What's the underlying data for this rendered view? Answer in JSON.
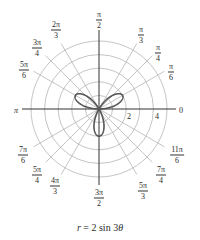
{
  "chart_data": {
    "type": "polar",
    "title": "r = 2 sin 3θ",
    "equation": "r = 2 sin 3θ",
    "curve": {
      "function": "2*sin(3*theta)",
      "theta_range": [
        0,
        3.14159265
      ],
      "petals": 3,
      "max_r": 2,
      "petal_directions": [
        "π/6",
        "5π/6",
        "3π/2"
      ],
      "color": "#555555"
    },
    "radial_circles": [
      1,
      2,
      3,
      4,
      5
    ],
    "radial_tick_labels": [
      "2",
      "4"
    ],
    "angle_labels": [
      {
        "num": "π",
        "den": "6",
        "angle_deg": 30
      },
      {
        "num": "π",
        "den": "4",
        "angle_deg": 45
      },
      {
        "num": "π",
        "den": "3",
        "angle_deg": 60
      },
      {
        "num": "π",
        "den": "2",
        "angle_deg": 90
      },
      {
        "num": "2π",
        "den": "3",
        "angle_deg": 120
      },
      {
        "num": "3π",
        "den": "4",
        "angle_deg": 135
      },
      {
        "num": "5π",
        "den": "6",
        "angle_deg": 150
      },
      {
        "num": "7π",
        "den": "6",
        "angle_deg": 210
      },
      {
        "num": "5π",
        "den": "4",
        "angle_deg": 225
      },
      {
        "num": "4π",
        "den": "3",
        "angle_deg": 240
      },
      {
        "num": "3π",
        "den": "2",
        "angle_deg": 270
      },
      {
        "num": "5π",
        "den": "3",
        "angle_deg": 300
      },
      {
        "num": "7π",
        "den": "4",
        "angle_deg": 315
      },
      {
        "num": "11π",
        "den": "6",
        "angle_deg": 330
      }
    ],
    "axis_labels": {
      "zero": "0",
      "pi": "π"
    },
    "grid": true,
    "rlim": [
      0,
      5
    ]
  },
  "caption": {
    "lhs": "r",
    "rhs": "= 2 sin 3",
    "theta": "θ"
  }
}
